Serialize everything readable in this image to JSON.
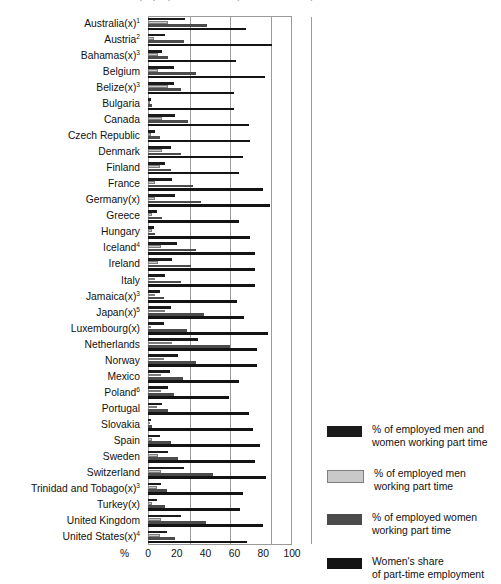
{
  "chart_title": "Employed part-time workers (selected countries)",
  "axis": {
    "x_unit_label": "%",
    "x_ticks": [
      0,
      20,
      40,
      60,
      80,
      100
    ],
    "xlim": [
      0,
      100
    ],
    "gridlines_at": [
      20,
      40,
      60,
      80
    ]
  },
  "legend": {
    "position": "right",
    "entries": [
      {
        "label": "% of employed men and\nwomen working part time",
        "color": "#1b1b1b",
        "key": "total"
      },
      {
        "label": "% of employed men\nworking part time",
        "color": "#c9c9c9",
        "key": "men"
      },
      {
        "label": "% of employed women\nworking part time",
        "color": "#4b4b4b",
        "key": "women"
      },
      {
        "label": "Women's share\nof part-time employment",
        "color": "#141414",
        "key": "share"
      }
    ]
  },
  "chart_data": {
    "type": "bar",
    "orientation": "horizontal",
    "title": "Employed part-time workers (selected countries)",
    "xlabel": "%",
    "ylabel": "",
    "xlim": [
      0,
      100
    ],
    "grid": true,
    "legend_position": "right",
    "categories": [
      "Australia(x)¹",
      "Austria²",
      "Bahamas(x)³",
      "Belgium",
      "Belize(x)³",
      "Bulgaria",
      "Canada",
      "Czech Republic",
      "Denmark",
      "Finland",
      "France",
      "Germany(x)",
      "Greece",
      "Hungary",
      "Iceland⁴",
      "Ireland",
      "Italy",
      "Jamaica(x)³",
      "Japan(x)⁵",
      "Luxembourg(x)",
      "Netherlands",
      "Norway",
      "Mexico",
      "Poland⁶",
      "Portugal",
      "Slovakia",
      "Spain",
      "Sweden",
      "Switzerland",
      "Trinidad and Tobago(x)³",
      "Turkey(x)",
      "United Kingdom",
      "United States(x)⁴"
    ],
    "series": [
      {
        "name": "% of employed men and women working part time",
        "key": "total",
        "color": "#1b1b1b",
        "values": [
          26,
          12,
          10,
          18,
          18,
          2,
          19,
          5,
          16,
          12,
          17,
          19,
          6,
          4,
          20,
          17,
          12,
          8,
          16,
          11,
          35,
          21,
          15,
          14,
          10,
          2,
          8,
          14,
          25,
          9,
          6,
          23,
          13
        ]
      },
      {
        "name": "% of employed men working part time",
        "key": "men",
        "color": "#c9c9c9",
        "values": [
          14,
          4,
          7,
          7,
          14,
          1,
          10,
          2,
          10,
          8,
          5,
          5,
          3,
          3,
          9,
          7,
          5,
          5,
          12,
          2,
          17,
          11,
          9,
          9,
          6,
          1,
          3,
          7,
          9,
          6,
          3,
          9,
          8
        ]
      },
      {
        "name": "% of employed women working part time",
        "key": "women",
        "color": "#4b4b4b",
        "values": [
          41,
          25,
          14,
          33,
          23,
          3,
          28,
          8,
          23,
          16,
          31,
          37,
          10,
          5,
          33,
          30,
          23,
          11,
          39,
          27,
          57,
          33,
          24,
          18,
          14,
          3,
          16,
          21,
          45,
          13,
          12,
          40,
          19
        ]
      },
      {
        "name": "Women's share of part-time employment",
        "key": "share",
        "color": "#141414",
        "values": [
          68,
          86,
          61,
          81,
          60,
          60,
          70,
          71,
          66,
          63,
          80,
          85,
          63,
          71,
          74,
          74,
          74,
          62,
          67,
          83,
          76,
          76,
          63,
          56,
          70,
          73,
          78,
          74,
          82,
          66,
          64,
          80,
          69
        ]
      }
    ]
  }
}
